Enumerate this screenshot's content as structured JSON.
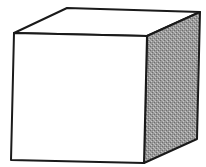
{
  "diagram": {
    "type": "3d-cube-line-drawing",
    "shape": "cube",
    "colors": {
      "stroke": "#1a1a1a",
      "front_face": "#ffffff",
      "top_face": "#ffffff",
      "side_face_shading": "#9a9a9a",
      "side_face_dots_dark": "#6e6e6e",
      "side_face_dots_light": "#c8c8c8",
      "background": "#ffffff"
    },
    "faces": {
      "front": {
        "label": "front face",
        "fill": "white"
      },
      "top": {
        "label": "top face",
        "fill": "white"
      },
      "right": {
        "label": "right side face",
        "fill": "stippled gray"
      }
    }
  }
}
